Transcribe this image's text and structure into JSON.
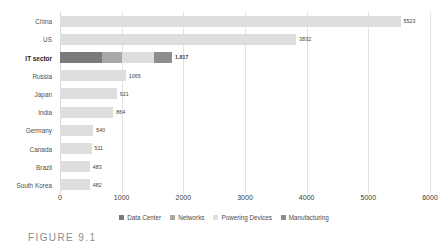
{
  "chart_data": {
    "type": "bar",
    "orientation": "horizontal",
    "stacked": true,
    "title": "",
    "xlabel": "",
    "ylabel": "",
    "xlim": [
      0,
      6000
    ],
    "xticks": [
      "0",
      "1000",
      "2000",
      "3000",
      "4000",
      "5000",
      "6000"
    ],
    "grid": true,
    "legend_position": "bottom",
    "categories": [
      "China",
      "US",
      "IT sector",
      "Russia",
      "Japan",
      "India",
      "Germany",
      "Canada",
      "Brazil",
      "South Korea"
    ],
    "emphasized_category": "IT sector",
    "values": [
      5523,
      3832,
      1817,
      1065,
      921,
      864,
      540,
      511,
      483,
      482
    ],
    "value_labels": [
      "5523",
      "3832",
      "1,817",
      "1065",
      "921",
      "864",
      "540",
      "511",
      "483",
      "482"
    ],
    "series": [
      {
        "name": "Data Center",
        "color": "#7a7a7a",
        "values": [
          0,
          0,
          683,
          0,
          0,
          0,
          0,
          0,
          0,
          0
        ]
      },
      {
        "name": "Networks",
        "color": "#a8a8a8",
        "values": [
          0,
          0,
          320,
          0,
          0,
          0,
          0,
          0,
          0,
          0
        ]
      },
      {
        "name": "Powering Devices",
        "color": "#dedede",
        "values": [
          5523,
          3832,
          524,
          1065,
          921,
          864,
          540,
          511,
          483,
          482
        ]
      },
      {
        "name": "Manufacturing",
        "color": "#8d8d8d",
        "values": [
          0,
          0,
          290,
          0,
          0,
          0,
          0,
          0,
          0,
          0
        ]
      }
    ]
  },
  "legend": {
    "items": [
      {
        "label": "Data Center",
        "color": "#7a7a7a"
      },
      {
        "label": "Networks",
        "color": "#a8a8a8"
      },
      {
        "label": "Powering Devices",
        "color": "#dedede"
      },
      {
        "label": "Manufacturing",
        "color": "#8d8d8d"
      }
    ]
  },
  "caption": {
    "text": "FIGURE 9.1"
  }
}
